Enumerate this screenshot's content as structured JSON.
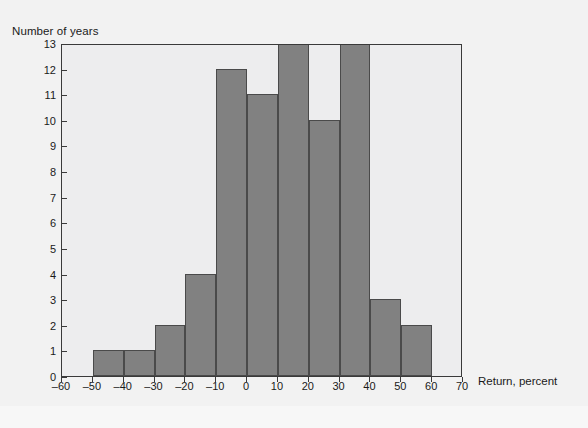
{
  "chart_data": {
    "type": "bar",
    "title": "",
    "xlabel": "Return, percent",
    "ylabel": "Number of years",
    "categories": [
      "-60 to -50",
      "-50 to -40",
      "-40 to -30",
      "-30 to -20",
      "-20 to -10",
      "-10 to 0",
      "0 to 10",
      "10 to 20",
      "20 to 30",
      "30 to 40",
      "40 to 50",
      "50 to 60",
      "60 to 70"
    ],
    "bin_edges": [
      -60,
      -50,
      -40,
      -30,
      -20,
      -10,
      0,
      10,
      20,
      30,
      40,
      50,
      60,
      70
    ],
    "values": [
      0,
      1,
      1,
      2,
      4,
      12,
      11,
      13,
      10,
      13,
      3,
      2,
      0
    ],
    "xlim": [
      -60,
      70
    ],
    "ylim": [
      0,
      13
    ],
    "xticks": [
      -60,
      -50,
      -40,
      -30,
      -20,
      -10,
      0,
      10,
      20,
      30,
      40,
      50,
      60,
      70
    ],
    "xtick_labels": [
      "–60",
      "–50",
      "–40",
      "–30",
      "–20",
      "–10",
      "0",
      "10",
      "20",
      "30",
      "40",
      "50",
      "60",
      "70"
    ],
    "yticks": [
      0,
      1,
      2,
      3,
      4,
      5,
      6,
      7,
      8,
      9,
      10,
      11,
      12,
      13
    ],
    "ytick_labels": [
      "0",
      "1",
      "2",
      "3",
      "4",
      "5",
      "6",
      "7",
      "8",
      "9",
      "10",
      "11",
      "12",
      "13"
    ],
    "grid": false,
    "legend": null,
    "bar_color": "#818181",
    "bar_edge_color": "#4a4a4a",
    "plot_bg_color": "#ededee",
    "frame_color": "#3a3a3a"
  }
}
